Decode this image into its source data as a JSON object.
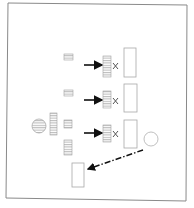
{
  "figure": {
    "colors": {
      "frame": "#8a8a8a",
      "stroke": "#9a9a9a",
      "arrow": "#111111",
      "background": "#ffffff"
    },
    "rows": [
      {
        "id": "row-1",
        "operator": "×"
      },
      {
        "id": "row-2",
        "operator": "×"
      },
      {
        "id": "row-3",
        "operator": "×"
      }
    ],
    "left_cluster": {
      "items": [
        "striped-circle",
        "tall-striped-bar",
        "small-striped-block",
        "lower-striped-block"
      ]
    },
    "extra": {
      "circle": "outline-circle",
      "connector": "dash-dot-arrow",
      "target": "bottom-block"
    }
  }
}
